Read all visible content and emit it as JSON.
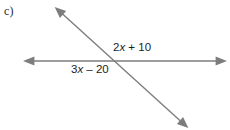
{
  "figure": {
    "part_label": "c)",
    "background_color": "#ffffff",
    "width": 230,
    "height": 130
  },
  "diagram": {
    "type": "two-intersecting-lines",
    "line_color": "#7d7d7d",
    "line_width": 1.4,
    "intersection": {
      "x": 113,
      "y": 61
    },
    "lines": [
      {
        "name": "horizontal-transversal",
        "start": {
          "x": 28,
          "y": 61
        },
        "end": {
          "x": 222,
          "y": 61
        },
        "arrow_start": true,
        "arrow_end": true
      },
      {
        "name": "diagonal-transversal",
        "start": {
          "x": 58,
          "y": 10
        },
        "end": {
          "x": 185,
          "y": 125
        },
        "arrow_start": true,
        "arrow_end": true
      }
    ],
    "labels": [
      {
        "name": "upper-right-angle-expression",
        "coefficient": "2",
        "variable": "x",
        "operator": "+",
        "constant": "10",
        "text": "2x + 10",
        "position": {
          "x": 113,
          "y": 41
        }
      },
      {
        "name": "lower-left-angle-expression",
        "coefficient": "3",
        "variable": "x",
        "operator": "–",
        "constant": "20",
        "text": "3x – 20",
        "position": {
          "x": 71,
          "y": 63
        }
      }
    ]
  }
}
